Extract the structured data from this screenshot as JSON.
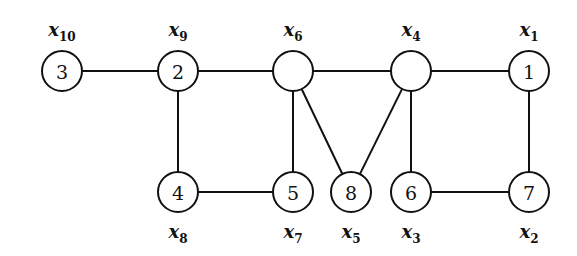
{
  "graph": {
    "radius": 20,
    "nodes": [
      {
        "id": "a",
        "label": "3",
        "var": "x",
        "sub": "10",
        "x": 62,
        "y": 71,
        "var_pos": "above"
      },
      {
        "id": "b",
        "label": "2",
        "var": "x",
        "sub": "9",
        "x": 178,
        "y": 71,
        "var_pos": "above"
      },
      {
        "id": "c",
        "label": "",
        "var": "x",
        "sub": "6",
        "x": 293,
        "y": 71,
        "var_pos": "above"
      },
      {
        "id": "d",
        "label": "",
        "var": "x",
        "sub": "4",
        "x": 411,
        "y": 71,
        "var_pos": "above"
      },
      {
        "id": "e",
        "label": "1",
        "var": "x",
        "sub": "1",
        "x": 529,
        "y": 71,
        "var_pos": "above"
      },
      {
        "id": "f",
        "label": "4",
        "var": "x",
        "sub": "8",
        "x": 178,
        "y": 192,
        "var_pos": "below"
      },
      {
        "id": "g",
        "label": "5",
        "var": "x",
        "sub": "7",
        "x": 293,
        "y": 192,
        "var_pos": "below"
      },
      {
        "id": "h",
        "label": "8",
        "var": "x",
        "sub": "5",
        "x": 351,
        "y": 192,
        "var_pos": "below"
      },
      {
        "id": "i",
        "label": "6",
        "var": "x",
        "sub": "3",
        "x": 411,
        "y": 192,
        "var_pos": "below"
      },
      {
        "id": "j",
        "label": "7",
        "var": "x",
        "sub": "2",
        "x": 529,
        "y": 192,
        "var_pos": "below"
      }
    ],
    "edges": [
      [
        "a",
        "b"
      ],
      [
        "b",
        "c"
      ],
      [
        "c",
        "d"
      ],
      [
        "d",
        "e"
      ],
      [
        "b",
        "f"
      ],
      [
        "f",
        "g"
      ],
      [
        "c",
        "g"
      ],
      [
        "c",
        "h"
      ],
      [
        "d",
        "h"
      ],
      [
        "d",
        "i"
      ],
      [
        "i",
        "j"
      ],
      [
        "e",
        "j"
      ]
    ]
  }
}
